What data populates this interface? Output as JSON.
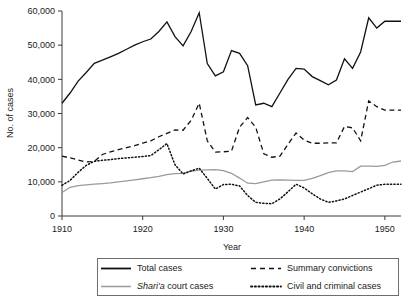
{
  "chart_data": {
    "type": "line",
    "title": "",
    "xlabel": "Year",
    "ylabel": "No. of cases",
    "xlim": [
      1910,
      1952
    ],
    "ylim": [
      0,
      60000
    ],
    "grid": false,
    "legend_position": "bottom",
    "xticks": [
      1910,
      1920,
      1930,
      1940,
      1950
    ],
    "xtick_labels": [
      "1910",
      "1920",
      "1930",
      "1940",
      "1950"
    ],
    "yticks": [
      0,
      10000,
      20000,
      30000,
      40000,
      50000,
      60000
    ],
    "ytick_labels": [
      "0",
      "10,000",
      "20,000",
      "30,000",
      "40,000",
      "50,000",
      "60,000"
    ],
    "x": [
      1910,
      1911,
      1912,
      1913,
      1914,
      1915,
      1916,
      1917,
      1918,
      1919,
      1920,
      1921,
      1922,
      1923,
      1924,
      1925,
      1926,
      1927,
      1928,
      1929,
      1930,
      1931,
      1932,
      1933,
      1934,
      1935,
      1936,
      1937,
      1938,
      1939,
      1940,
      1941,
      1942,
      1943,
      1944,
      1945,
      1946,
      1947,
      1948,
      1949,
      1950,
      1951,
      1952
    ],
    "series": [
      {
        "name": "Total cases",
        "style": "solid",
        "color": "#111111",
        "values": [
          33000,
          36000,
          39500,
          42000,
          44700,
          45600,
          46600,
          47600,
          48800,
          50000,
          51000,
          51800,
          54000,
          56800,
          52500,
          49800,
          54000,
          59500,
          44600,
          41000,
          42200,
          48400,
          47600,
          44000,
          32500,
          33000,
          32000,
          36000,
          40000,
          43200,
          43000,
          40800,
          39600,
          38400,
          39800,
          46000,
          43200,
          48000,
          58000,
          55000,
          57000,
          57000,
          57000
        ]
      },
      {
        "name": "Summary convictions",
        "style": "dashed",
        "color": "#111111",
        "values": [
          17500,
          17000,
          16400,
          15800,
          16000,
          18000,
          18800,
          19400,
          20000,
          20600,
          21300,
          22000,
          23200,
          24200,
          25200,
          25100,
          28000,
          33000,
          22000,
          18700,
          18800,
          19000,
          26000,
          28800,
          26000,
          18200,
          17200,
          17500,
          21000,
          24300,
          22200,
          21300,
          21300,
          21400,
          21400,
          26200,
          25800,
          22000,
          33700,
          32000,
          31000,
          31000,
          31000
        ]
      },
      {
        "name": "Shari'a court cases",
        "style": "solid",
        "color": "#9a9a9a",
        "values": [
          6900,
          8400,
          8900,
          9100,
          9300,
          9500,
          9700,
          10000,
          10300,
          10600,
          10900,
          11200,
          11600,
          12100,
          12400,
          12500,
          13100,
          13400,
          13500,
          13600,
          13300,
          12500,
          11100,
          9600,
          9500,
          10000,
          10500,
          10600,
          10500,
          10400,
          10400,
          11000,
          11800,
          12700,
          13200,
          13200,
          13000,
          14600,
          14600,
          14500,
          14800,
          15800,
          16100
        ]
      },
      {
        "name": "Civil and criminal cases",
        "style": "dotted",
        "color": "#111111",
        "values": [
          9000,
          10400,
          12800,
          14800,
          16000,
          16300,
          16500,
          16800,
          17000,
          17200,
          17400,
          17700,
          19400,
          21200,
          15000,
          12300,
          13200,
          14000,
          11000,
          7900,
          9200,
          9300,
          8800,
          6000,
          4000,
          3700,
          3600,
          5000,
          7100,
          9300,
          8200,
          6500,
          5000,
          4000,
          4400,
          5000,
          6000,
          7000,
          8000,
          9000,
          9300,
          9300,
          9300
        ]
      }
    ]
  },
  "legend": {
    "entries": [
      {
        "label": "Total cases",
        "icon": "solid-line-swatch"
      },
      {
        "label": "Summary convictions",
        "icon": "dashed-line-swatch"
      },
      {
        "label_italic": "Shari'a",
        "label": " court cases",
        "icon": "gray-solid-line-swatch"
      },
      {
        "label": "Civil and criminal cases",
        "icon": "dotted-line-swatch"
      }
    ]
  }
}
